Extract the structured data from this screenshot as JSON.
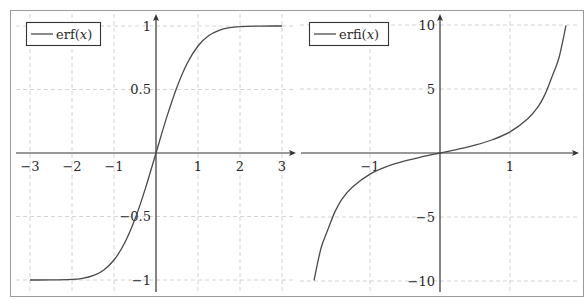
{
  "chart_data": [
    {
      "type": "line",
      "title": "",
      "xlabel": "",
      "ylabel": "",
      "grid": true,
      "legend_position": "top-left",
      "xlim": [
        -3,
        3
      ],
      "ylim": [
        -1,
        1
      ],
      "x_ticks": [
        "−3",
        "−2",
        "−1",
        "1",
        "2",
        "3"
      ],
      "y_ticks": [
        "1",
        "0.5",
        "−0.5",
        "−1"
      ],
      "series": [
        {
          "name": "erf(x)",
          "legend_label": "erf(x)",
          "x": [
            -3,
            -2.5,
            -2,
            -1.75,
            -1.5,
            -1.25,
            -1,
            -0.75,
            -0.5,
            -0.25,
            0,
            0.25,
            0.5,
            0.75,
            1,
            1.25,
            1.5,
            1.75,
            2,
            2.5,
            3
          ],
          "values": [
            -1,
            -0.9996,
            -0.9953,
            -0.9867,
            -0.9661,
            -0.9229,
            -0.8427,
            -0.7112,
            -0.5205,
            -0.2763,
            0,
            0.2763,
            0.5205,
            0.7112,
            0.8427,
            0.9229,
            0.9661,
            0.9867,
            0.9953,
            0.9996,
            1
          ]
        }
      ]
    },
    {
      "type": "line",
      "title": "",
      "xlabel": "",
      "ylabel": "",
      "grid": true,
      "legend_position": "top-left",
      "xlim": [
        -2,
        2
      ],
      "ylim": [
        -10,
        10
      ],
      "x_ticks": [
        "−1",
        "1"
      ],
      "y_ticks": [
        "10",
        "5",
        "−5",
        "−10"
      ],
      "series": [
        {
          "name": "erfi(x)",
          "legend_label": "erfi(x)",
          "x": [
            -1.8,
            -1.7,
            -1.6,
            -1.5,
            -1.4,
            -1.25,
            -1,
            -0.75,
            -0.5,
            -0.25,
            0,
            0.25,
            0.5,
            0.75,
            1,
            1.25,
            1.4,
            1.5,
            1.6,
            1.7,
            1.8
          ],
          "values": [
            -9.96,
            -7.44,
            -5.96,
            -4.58,
            -3.6,
            -2.66,
            -1.65,
            -1.035,
            -0.615,
            -0.287,
            0,
            0.287,
            0.615,
            1.035,
            1.65,
            2.66,
            3.6,
            4.58,
            5.96,
            7.44,
            9.96
          ]
        }
      ]
    }
  ],
  "left_plot": {
    "legend": {
      "prefix": "erf(",
      "var": "x",
      "suffix": ")"
    },
    "x_ticks": [
      "−3",
      "−2",
      "−1",
      "1",
      "2",
      "3"
    ],
    "y_ticks": [
      "1",
      "0.5",
      "−0.5",
      "−1"
    ]
  },
  "right_plot": {
    "legend": {
      "prefix": "erfi(",
      "var": "x",
      "suffix": ")"
    },
    "x_ticks": [
      "−1",
      "1"
    ],
    "y_ticks": [
      "10",
      "5",
      "−5",
      "−10"
    ]
  }
}
